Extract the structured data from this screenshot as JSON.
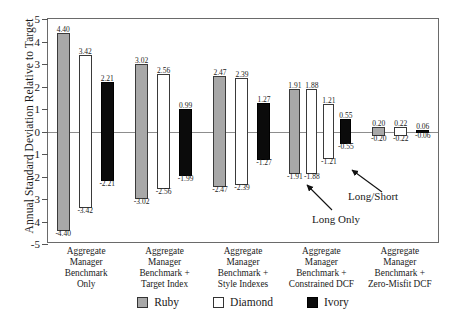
{
  "chart_data": {
    "type": "bar",
    "title": "",
    "xlabel": "",
    "ylabel": "Annual Standard Deviation Relative to Target",
    "ylim": [
      -5,
      5
    ],
    "ytick_labels": [
      "5",
      "4",
      "3",
      "2",
      "1",
      "0",
      "-1",
      "-2",
      "-3",
      "-4",
      "-5"
    ],
    "ytick_values": [
      5,
      4,
      3,
      2,
      1,
      0,
      -1,
      -2,
      -3,
      -4,
      -5
    ],
    "grid": false,
    "legend_position": "bottom-center",
    "legend": [
      "Ruby",
      "Diamond",
      "Ivory"
    ],
    "series_colors": {
      "Ruby": "#a8a8a8",
      "Diamond": "#ffffff",
      "Ivory": "#0b0b0b"
    },
    "categories": [
      "Aggregate Manager Benchmark Only",
      "Aggregate Manager Benchmark + Target Index",
      "Aggregate Manager Benchmark + Style Indexes",
      "Aggregate Manager Benchmark + Constrained DCF",
      "Aggregate Manager Benchmark + Zero-Misfit DCF"
    ],
    "groups": [
      {
        "category_lines": [
          "Aggregate",
          "Manager",
          "Benchmark",
          "Only"
        ],
        "bars": [
          {
            "series": "Ruby",
            "top": 4.4,
            "bottom": -4.4,
            "top_label": "4.40",
            "bottom_label": "-4.40"
          },
          {
            "series": "Diamond",
            "top": 3.42,
            "bottom": -3.42,
            "top_label": "3.42",
            "bottom_label": "-3.42"
          },
          {
            "series": "Ivory",
            "top": 2.21,
            "bottom": -2.21,
            "top_label": "2.21",
            "bottom_label": "-2.21"
          }
        ]
      },
      {
        "category_lines": [
          "Aggregate",
          "Manager",
          "Benchmark +",
          "Target Index"
        ],
        "bars": [
          {
            "series": "Ruby",
            "top": 3.02,
            "bottom": -3.02,
            "top_label": "3.02",
            "bottom_label": "-3.02"
          },
          {
            "series": "Diamond",
            "top": 2.56,
            "bottom": -2.56,
            "top_label": "2.56",
            "bottom_label": "-2.56"
          },
          {
            "series": "Ivory",
            "top": 0.99,
            "bottom": -1.99,
            "top_label": "0.99",
            "bottom_label": "-1.99"
          }
        ]
      },
      {
        "category_lines": [
          "Aggregate",
          "Manager",
          "Benchmark +",
          "Style Indexes"
        ],
        "bars": [
          {
            "series": "Ruby",
            "top": 2.47,
            "bottom": -2.47,
            "top_label": "2.47",
            "bottom_label": "-2.47"
          },
          {
            "series": "Diamond",
            "top": 2.39,
            "bottom": -2.39,
            "top_label": "2.39",
            "bottom_label": "-2.39"
          },
          {
            "series": "Ivory",
            "top": 1.27,
            "bottom": -1.27,
            "top_label": "1.27",
            "bottom_label": "-1.27"
          }
        ]
      },
      {
        "category_lines": [
          "Aggregate",
          "Manager",
          "Benchmark +",
          "Constrained DCF"
        ],
        "bars": [
          {
            "series": "Ruby",
            "top": 1.91,
            "bottom": -1.91,
            "top_label": "1.91",
            "bottom_label": "-1.91"
          },
          {
            "series": "Diamond",
            "top": 1.88,
            "bottom": -1.88,
            "top_label": "1.88",
            "bottom_label": "-1.88"
          },
          {
            "series": "Diamond",
            "top": 1.21,
            "bottom": -1.21,
            "top_label": "1.21",
            "bottom_label": "-1.21"
          },
          {
            "series": "Ivory",
            "top": 0.55,
            "bottom": -0.55,
            "top_label": "0.55",
            "bottom_label": "-0.55"
          }
        ]
      },
      {
        "category_lines": [
          "Aggregate",
          "Manager",
          "Benchmark +",
          "Zero-Misfit DCF"
        ],
        "bars": [
          {
            "series": "Ruby",
            "top": 0.2,
            "bottom": -0.2,
            "top_label": "0.20",
            "bottom_label": "-0.20"
          },
          {
            "series": "Diamond",
            "top": 0.22,
            "bottom": -0.22,
            "top_label": "0.22",
            "bottom_label": "-0.22"
          },
          {
            "series": "Ivory",
            "top": 0.06,
            "bottom": -0.06,
            "top_label": "0.06",
            "bottom_label": "-0.06"
          }
        ]
      }
    ],
    "annotations": [
      {
        "text": "Long Only",
        "points_to": "group4-bar2"
      },
      {
        "text": "Long/Short",
        "points_to": "group4-bar3"
      }
    ]
  },
  "axis": {
    "y_title": "Annual Standard Deviation Relative to Target"
  },
  "legend": {
    "items": [
      {
        "label": "Ruby",
        "swatch": "ruby"
      },
      {
        "label": "Diamond",
        "swatch": "diamond"
      },
      {
        "label": "Ivory",
        "swatch": "ivory"
      }
    ]
  },
  "annotations": {
    "long_only": "Long Only",
    "long_short": "Long/Short"
  }
}
